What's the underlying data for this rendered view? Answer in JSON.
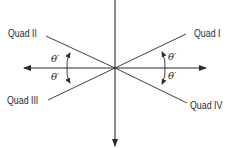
{
  "diagram": {
    "title": "",
    "colors": {
      "line": "#2a2a2a",
      "background": "#ffffff"
    },
    "origin": [
      115,
      68
    ],
    "axes": {
      "horizontal": {
        "from": [
          24,
          68
        ],
        "to": [
          206,
          68
        ],
        "arrows": "both"
      },
      "vertical": {
        "from": [
          115,
          0
        ],
        "to": [
          115,
          146
        ],
        "arrows": "bottom"
      }
    },
    "rays": [
      {
        "quadrant": "Quad I",
        "end": [
          186,
          34
        ]
      },
      {
        "quadrant": "Quad II",
        "end": [
          46,
          36
        ]
      },
      {
        "quadrant": "Quad III",
        "end": [
          48,
          100
        ]
      },
      {
        "quadrant": "Quad IV",
        "end": [
          187,
          103
        ]
      }
    ],
    "labels": {
      "quad1": "Quad I",
      "quad2": "Quad II",
      "quad3": "Quad III",
      "quad4": "Quad IV",
      "theta_q1": "θ′",
      "theta_q2": "θ′",
      "theta_q3": "θ′",
      "theta_q4": "θ′"
    }
  }
}
